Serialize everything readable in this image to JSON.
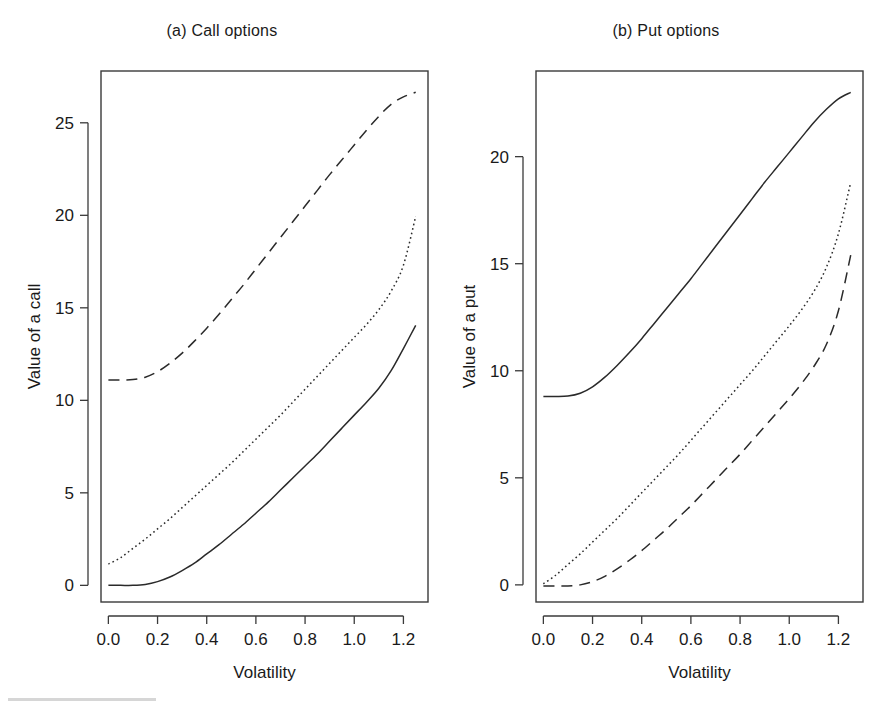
{
  "figure": {
    "background": "#ffffff",
    "ink_color": "#2a2a2a"
  },
  "panels": [
    {
      "id": "a",
      "title": "(a) Call options",
      "xlabel": "Volatility",
      "ylabel": "Value of a call"
    },
    {
      "id": "b",
      "title": "(b) Put options",
      "xlabel": "Volatility",
      "ylabel": "Value of a put"
    }
  ],
  "chart_data": [
    {
      "type": "line",
      "title": "(a) Call options",
      "xlabel": "Volatility",
      "ylabel": "Value of a call",
      "xlim": [
        -0.03,
        1.3
      ],
      "ylim": [
        -0.9,
        27.8
      ],
      "xticks": [
        0.0,
        0.2,
        0.4,
        0.6,
        0.8,
        1.0,
        1.2
      ],
      "xticklabels": [
        "0.0",
        "0.2",
        "0.4",
        "0.6",
        "0.8",
        "1.0",
        "1.2"
      ],
      "yticks": [
        0,
        5,
        10,
        15,
        20,
        25
      ],
      "yticklabels": [
        "0",
        "5",
        "10",
        "15",
        "20",
        "25"
      ],
      "grid": false,
      "legend": "none",
      "x": [
        0.0,
        0.05,
        0.1,
        0.15,
        0.2,
        0.25,
        0.3,
        0.35,
        0.4,
        0.45,
        0.5,
        0.55,
        0.6,
        0.65,
        0.7,
        0.75,
        0.8,
        0.85,
        0.9,
        0.95,
        1.0,
        1.05,
        1.1,
        1.15,
        1.2,
        1.25
      ],
      "series": [
        {
          "name": "in-the-money call (dashed)",
          "style": "dashed",
          "values": [
            11.1,
            11.1,
            11.12,
            11.25,
            11.55,
            12.0,
            12.55,
            13.2,
            13.9,
            14.65,
            15.45,
            16.25,
            17.1,
            17.95,
            18.8,
            19.65,
            20.5,
            21.35,
            22.2,
            23.0,
            23.8,
            24.6,
            25.35,
            26.0,
            26.4,
            26.65
          ]
        },
        {
          "name": "at-the-money call (dotted)",
          "style": "dotted",
          "values": [
            1.15,
            1.5,
            2.0,
            2.5,
            3.05,
            3.6,
            4.2,
            4.8,
            5.4,
            6.0,
            6.6,
            7.25,
            7.9,
            8.55,
            9.2,
            9.9,
            10.6,
            11.3,
            12.0,
            12.7,
            13.4,
            14.1,
            14.9,
            15.9,
            17.3,
            19.95
          ]
        },
        {
          "name": "out-of-the-money call (solid)",
          "style": "solid",
          "values": [
            0.0,
            0.0,
            0.0,
            0.05,
            0.2,
            0.45,
            0.8,
            1.2,
            1.7,
            2.2,
            2.75,
            3.3,
            3.9,
            4.5,
            5.15,
            5.8,
            6.45,
            7.1,
            7.8,
            8.5,
            9.2,
            9.9,
            10.65,
            11.6,
            12.8,
            14.05
          ]
        }
      ]
    },
    {
      "type": "line",
      "title": "(b) Put options",
      "xlabel": "Volatility",
      "ylabel": "Value of a put",
      "xlim": [
        -0.03,
        1.3
      ],
      "ylim": [
        -0.8,
        24.0
      ],
      "xticks": [
        0.0,
        0.2,
        0.4,
        0.6,
        0.8,
        1.0,
        1.2
      ],
      "xticklabels": [
        "0.0",
        "0.2",
        "0.4",
        "0.6",
        "0.8",
        "1.0",
        "1.2"
      ],
      "yticks": [
        0,
        5,
        10,
        15,
        20
      ],
      "yticklabels": [
        "0",
        "5",
        "10",
        "15",
        "20"
      ],
      "grid": false,
      "legend": "none",
      "x": [
        0.0,
        0.05,
        0.1,
        0.15,
        0.2,
        0.25,
        0.3,
        0.35,
        0.4,
        0.45,
        0.5,
        0.55,
        0.6,
        0.65,
        0.7,
        0.75,
        0.8,
        0.85,
        0.9,
        0.95,
        1.0,
        1.05,
        1.1,
        1.15,
        1.2,
        1.25
      ],
      "series": [
        {
          "name": "in-the-money put (solid)",
          "style": "solid",
          "values": [
            8.8,
            8.8,
            8.82,
            8.95,
            9.25,
            9.7,
            10.25,
            10.85,
            11.5,
            12.2,
            12.9,
            13.6,
            14.3,
            15.05,
            15.8,
            16.55,
            17.3,
            18.05,
            18.8,
            19.5,
            20.2,
            20.9,
            21.6,
            22.2,
            22.7,
            23.0
          ]
        },
        {
          "name": "at-the-money put (dotted)",
          "style": "dotted",
          "values": [
            0.05,
            0.45,
            0.95,
            1.45,
            2.0,
            2.55,
            3.1,
            3.7,
            4.3,
            4.9,
            5.5,
            6.1,
            6.75,
            7.4,
            8.05,
            8.7,
            9.35,
            10.0,
            10.7,
            11.4,
            12.1,
            12.85,
            13.7,
            14.8,
            16.4,
            18.8
          ]
        },
        {
          "name": "out-of-the-money put (dashed)",
          "style": "dashed",
          "values": [
            -0.05,
            -0.05,
            -0.05,
            0.0,
            0.15,
            0.4,
            0.75,
            1.15,
            1.6,
            2.1,
            2.6,
            3.15,
            3.7,
            4.3,
            4.9,
            5.5,
            6.1,
            6.75,
            7.4,
            8.05,
            8.7,
            9.4,
            10.2,
            11.2,
            12.8,
            15.4
          ]
        }
      ]
    }
  ]
}
